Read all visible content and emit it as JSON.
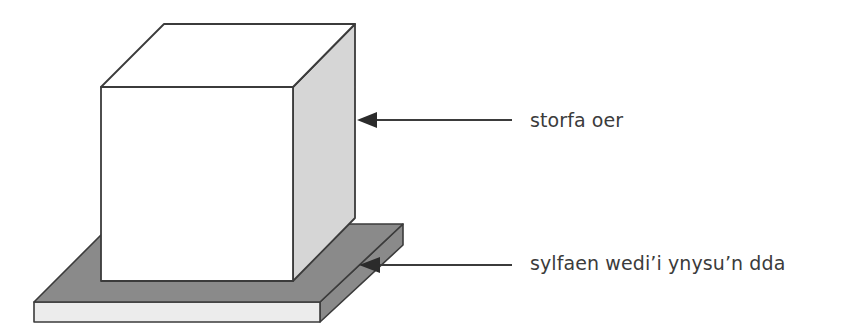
{
  "diagram": {
    "background_color": "#ffffff",
    "stroke_color": "#3b3b3b",
    "labels": [
      {
        "id": "cold-store",
        "text": "storfa oer",
        "points_to": "cube-right-face"
      },
      {
        "id": "insulated-base",
        "text": "sylfaen wedi’i ynysu’n dda",
        "points_to": "slab-right-face"
      }
    ],
    "shapes": {
      "cube": {
        "name": "cold-store-cube",
        "front_face_color": "#ffffff",
        "top_face_color": "#ffffff",
        "right_face_color": "#d6d6d6",
        "front_face": "101,87 293,87 293,281 101,281",
        "top_face": "101,87 164,24 355,24 293,87",
        "right_face": "293,87 355,24 355,218 293,281"
      },
      "slab": {
        "name": "insulated-base-slab",
        "top_face_color": "#8a8a8a",
        "front_face_color": "#ececec",
        "right_face_color": "#8a8a8a",
        "top_face": "34,302 112,224 403,224 320,302",
        "front_face": "34,302 320,302 320,322 34,322",
        "right_face": "320,302 403,224 403,245 320,322"
      }
    },
    "arrows": [
      {
        "name": "arrow-to-cold-store",
        "from_x": 512,
        "from_y": 120,
        "to_x": 358,
        "to_y": 120
      },
      {
        "name": "arrow-to-insulated-base",
        "from_x": 512,
        "from_y": 265,
        "to_x": 360,
        "to_y": 265
      }
    ]
  }
}
